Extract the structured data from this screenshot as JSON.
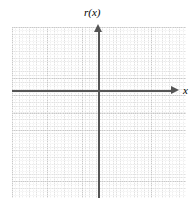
{
  "figure": {
    "name": "empty-cartesian-coordinate-grid",
    "background_color": "#ffffff"
  },
  "chart_data": {
    "type": "scatter",
    "title": "",
    "subtitle": "",
    "xlabel": "x",
    "ylabel": "r(x)",
    "series": [
      {
        "name": "r(x)",
        "x": [],
        "y": []
      }
    ],
    "x": [],
    "categories": [],
    "values": [],
    "xlim": [
      -5,
      5
    ],
    "ylim": [
      -6,
      4
    ],
    "xticks": [],
    "yticks": [],
    "xticklabels": [],
    "yticklabels": [],
    "grid": true,
    "grid_major_divisions_x": 10,
    "grid_major_divisions_y": 10,
    "grid_minor_per_major": 5,
    "legend": false,
    "legend_position": "none",
    "annotations": []
  },
  "axes": {
    "horizontal": {
      "label": "x",
      "color": "#555555",
      "arrow_direction": "right"
    },
    "vertical": {
      "label": "r(x)",
      "color": "#555555",
      "arrow_direction": "up"
    }
  },
  "grid": {
    "major_line_color": "#c9c9c9",
    "minor_line_color": "#e2e2e2",
    "style": "dotted-minor-solid-major"
  }
}
